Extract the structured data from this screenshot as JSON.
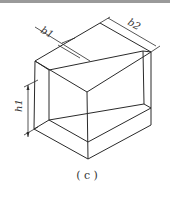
{
  "figure": {
    "caption": "( c )",
    "dimensions": {
      "b1": "b1",
      "b2": "b2",
      "h1": "h1"
    },
    "colors": {
      "line": "#2a2a2a",
      "top_border": "#9a9a9a",
      "background": "#ffffff"
    }
  }
}
